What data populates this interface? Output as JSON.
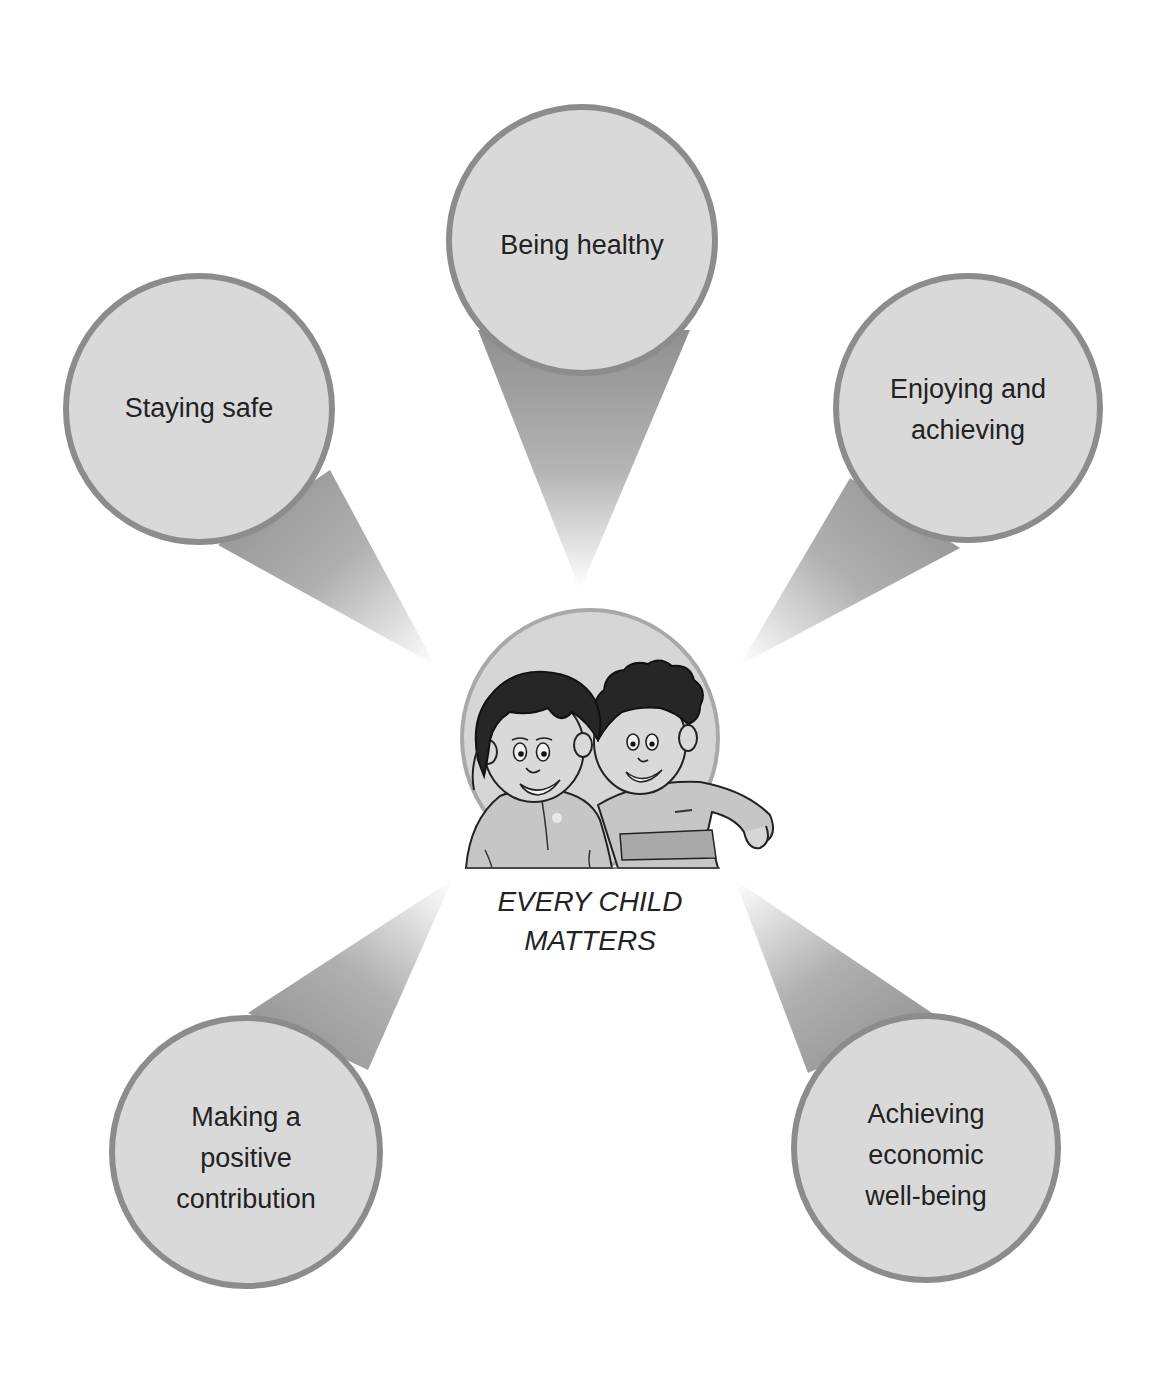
{
  "diagram": {
    "title": "EVERY CHILD\nMATTERS",
    "center_image": "two-children-illustration",
    "colors": {
      "circle_fill": "#d9d9d9",
      "circle_stroke": "#8c8c8c",
      "beam_dark": "#8f8f8f",
      "beam_light": "#ffffff",
      "text": "#222222",
      "background": "#ffffff"
    },
    "outcomes": [
      {
        "id": "being-healthy",
        "label": "Being healthy"
      },
      {
        "id": "staying-safe",
        "label": "Staying safe"
      },
      {
        "id": "enjoying-and-achieving",
        "label": "Enjoying and\nachieving"
      },
      {
        "id": "making-a-positive-contribution",
        "label": "Making a\npositive\ncontribution"
      },
      {
        "id": "achieving-economic-well-being",
        "label": "Achieving\neconomic\nwell-being"
      }
    ]
  }
}
